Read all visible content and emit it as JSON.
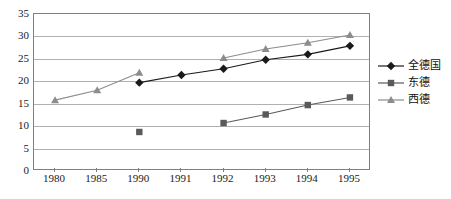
{
  "chart_data": {
    "type": "line",
    "title": "",
    "xlabel": "",
    "ylabel": "",
    "categories": [
      "1980",
      "1985",
      "1990",
      "1991",
      "1992",
      "1993",
      "1994",
      "1995"
    ],
    "ylim": [
      0,
      35
    ],
    "ytick_labels": [
      "0",
      "5",
      "10",
      "15",
      "20",
      "25",
      "30",
      "35"
    ],
    "ytick_values": [
      0,
      5,
      10,
      15,
      20,
      25,
      30,
      35
    ],
    "grid": true,
    "legend_position": "right",
    "series": [
      {
        "name": "全德国",
        "marker": "diamond",
        "color": "#1a1a1a",
        "values": [
          null,
          null,
          19.7,
          21.4,
          22.8,
          24.8,
          26.0,
          27.9
        ]
      },
      {
        "name": "东德",
        "marker": "square",
        "color": "#5a5a5a",
        "values": [
          null,
          null,
          8.7,
          null,
          10.7,
          12.6,
          14.7,
          16.4
        ]
      },
      {
        "name": "西德",
        "marker": "triangle",
        "color": "#8c8c8c",
        "values": [
          15.8,
          18.0,
          21.9,
          null,
          25.2,
          27.2,
          28.6,
          30.3
        ]
      }
    ]
  },
  "legend": {
    "items": [
      {
        "label": "全德国",
        "marker": "diamond-marker-icon"
      },
      {
        "label": "东德",
        "marker": "square-marker-icon"
      },
      {
        "label": "西德",
        "marker": "triangle-marker-icon"
      }
    ]
  },
  "colors": {
    "series_all_germany": "#1a1a1a",
    "series_east_germany": "#5a5a5a",
    "series_west_germany": "#8c8c8c",
    "gridline": "#b0b0b0",
    "frame": "#808080",
    "background": "#ffffff"
  }
}
